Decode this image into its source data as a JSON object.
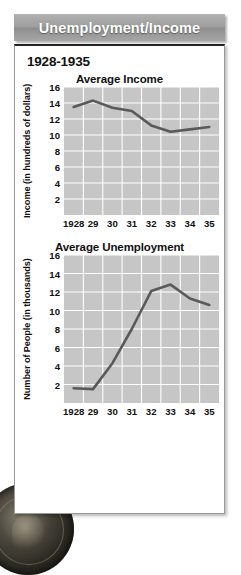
{
  "banner": {
    "title": "Unemployment/Income"
  },
  "card": {
    "date_range": "1928-1935"
  },
  "colors": {
    "banner_bg": "#9d9d9d",
    "plot_bg": "#c6c6c6",
    "gridline": "#ffffff",
    "line": "#5a5a5a",
    "text": "#111111"
  },
  "icons": {
    "coin": "coin-photo"
  },
  "chart_data": [
    {
      "type": "line",
      "title": "Average Income",
      "xlabel": "",
      "ylabel": "Income (in hundreds of dollars)",
      "categories": [
        "1928",
        "29",
        "30",
        "31",
        "32",
        "33",
        "34",
        "35"
      ],
      "x": [
        1928,
        1929,
        1930,
        1931,
        1932,
        1933,
        1934,
        1935
      ],
      "values": [
        13.5,
        14.3,
        13.4,
        13.0,
        11.2,
        10.4,
        10.7,
        11.0
      ],
      "yticks": [
        16,
        14,
        12,
        10,
        8,
        6,
        4,
        2
      ],
      "ylim": [
        0,
        16
      ],
      "grid": true,
      "legend": "none"
    },
    {
      "type": "line",
      "title": "Average Unemployment",
      "xlabel": "",
      "ylabel": "Number of People (in thousands)",
      "categories": [
        "1928",
        "29",
        "30",
        "31",
        "32",
        "33",
        "34",
        "35"
      ],
      "x": [
        1928,
        1929,
        1930,
        1931,
        1932,
        1933,
        1934,
        1935
      ],
      "values": [
        1.6,
        1.5,
        4.3,
        8.0,
        12.1,
        12.8,
        11.3,
        10.6
      ],
      "yticks": [
        16,
        14,
        12,
        10,
        8,
        6,
        4,
        2
      ],
      "ylim": [
        0,
        16
      ],
      "grid": true,
      "legend": "none"
    }
  ]
}
